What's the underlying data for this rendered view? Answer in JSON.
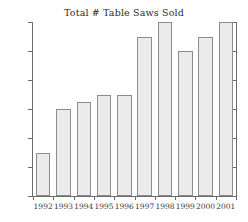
{
  "chart_data": {
    "type": "bar",
    "title": "Total # Table Saws Sold",
    "xlabel": "",
    "ylabel": "",
    "categories": [
      "1992",
      "1993",
      "1994",
      "1995",
      "1996",
      "1997",
      "1998",
      "1999",
      "2000",
      "2001"
    ],
    "values": [
      30,
      60,
      65,
      70,
      70,
      110,
      120,
      100,
      110,
      120
    ],
    "ylim": [
      0,
      120
    ],
    "yticks": [
      0,
      20,
      40,
      60,
      80,
      100,
      120
    ],
    "ytick_labels": [
      "0",
      "20",
      "40",
      "60",
      "80",
      "100",
      "120"
    ],
    "grid": false,
    "legend": false,
    "bar_fill_color": "#ebebeb",
    "bar_border_color": "#8c8c8c",
    "axis_color": "#6b6b6b",
    "background_color": "#ffffff",
    "text_color": "#2a2a2a"
  }
}
